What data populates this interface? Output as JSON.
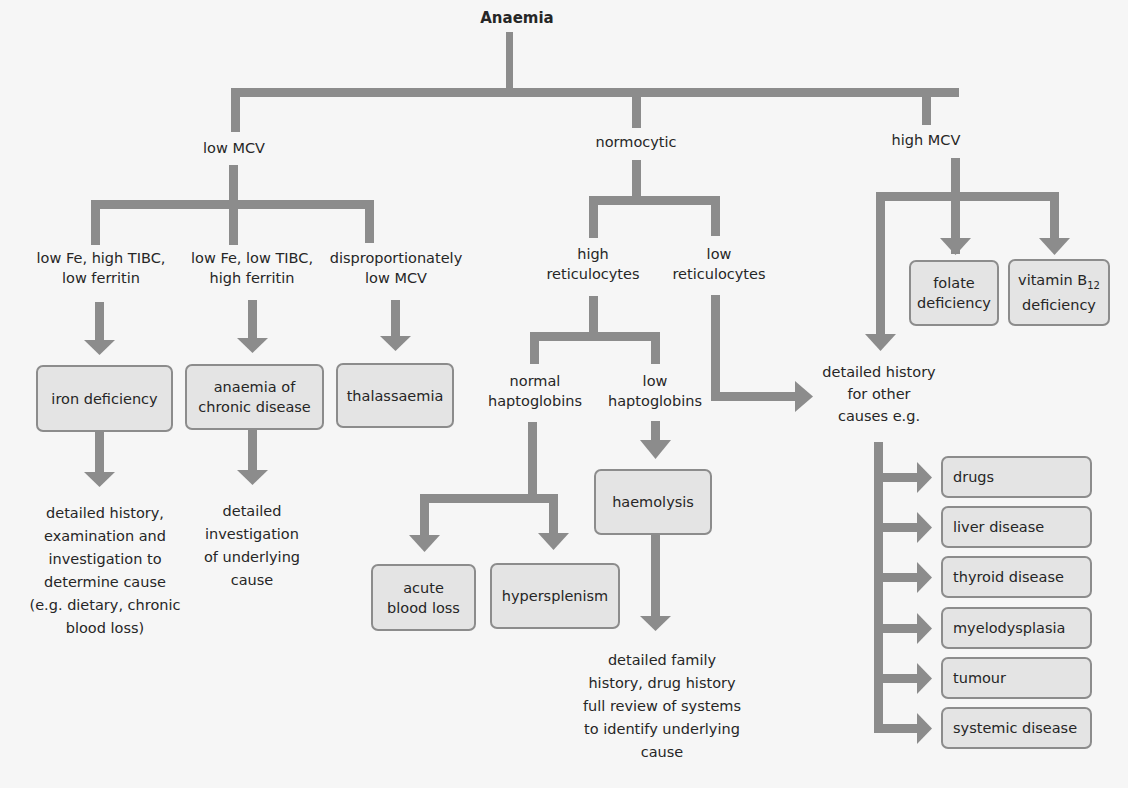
{
  "diagram": {
    "title": "Anaemia",
    "line_color": "#8c8c8c",
    "box_fill": "#e4e4e4",
    "box_border": "#8c8c8c",
    "branches": {
      "low_mcv": {
        "label": "low MCV",
        "tests": [
          {
            "line1": "low Fe, high TIBC,",
            "line2": "low ferritin"
          },
          {
            "line1": "low Fe, low TIBC,",
            "line2": "high ferritin"
          },
          {
            "line1": "disproportionately",
            "line2": "low MCV"
          }
        ],
        "diagnoses": [
          {
            "line1": "iron deficiency"
          },
          {
            "line1": "anaemia of",
            "line2": "chronic disease"
          },
          {
            "line1": "thalassaemia"
          }
        ],
        "followups": [
          {
            "lines": [
              "detailed history,",
              "examination and",
              "investigation to",
              "determine cause",
              "(e.g. dietary, chronic",
              "blood loss)"
            ]
          },
          {
            "lines": [
              "detailed",
              "investigation",
              "of underlying",
              "cause"
            ]
          }
        ]
      },
      "normocytic": {
        "label": "normocytic",
        "high_retic": {
          "line1": "high",
          "line2": "reticulocytes"
        },
        "low_retic": {
          "line1": "low",
          "line2": "reticulocytes"
        },
        "normal_hapto": {
          "line1": "normal",
          "line2": "haptoglobins"
        },
        "low_hapto": {
          "line1": "low",
          "line2": "haptoglobins"
        },
        "acute_blood_loss": {
          "line1": "acute",
          "line2": "blood loss"
        },
        "hypersplenism": "hypersplenism",
        "haemolysis": "haemolysis",
        "haemolysis_followup": [
          "detailed family",
          "history, drug history",
          "full review of systems",
          "to identify underlying",
          "cause"
        ]
      },
      "high_mcv": {
        "label": "high MCV",
        "folate": {
          "line1": "folate",
          "line2": "deficiency"
        },
        "b12": {
          "line1": "vitamin B",
          "sub": "12",
          "line2": "deficiency"
        },
        "other_causes": [
          "detailed history",
          "for other",
          "causes e.g."
        ],
        "causes": [
          "drugs",
          "liver disease",
          "thyroid disease",
          "myelodysplasia",
          "tumour",
          "systemic disease"
        ]
      }
    }
  }
}
